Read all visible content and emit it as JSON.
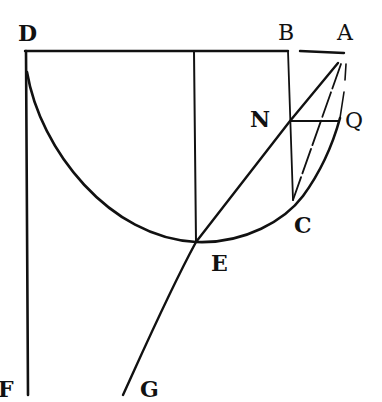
{
  "figure": {
    "type": "geometric-construction",
    "stroke_color": "#111111",
    "background": "#ffffff",
    "labels": [
      {
        "id": "D",
        "text": "D",
        "x": 18,
        "y": 22
      },
      {
        "id": "B",
        "text": "B",
        "x": 278,
        "y": 22
      },
      {
        "id": "A",
        "text": "A",
        "x": 337,
        "y": 22
      },
      {
        "id": "N",
        "text": "N",
        "x": 248,
        "y": 110
      },
      {
        "id": "Q",
        "text": "Q",
        "x": 345,
        "y": 110
      },
      {
        "id": "C",
        "text": "C",
        "x": 293,
        "y": 214
      },
      {
        "id": "E",
        "text": "E",
        "x": 211,
        "y": 252
      },
      {
        "id": "F",
        "text": "F",
        "x": 0,
        "y": 380
      },
      {
        "id": "G",
        "text": "G",
        "x": 140,
        "y": 380
      }
    ],
    "points": {
      "D": [
        25,
        51
      ],
      "B": [
        288,
        51
      ],
      "A": [
        344,
        53
      ],
      "N": [
        290,
        121
      ],
      "Q": [
        338,
        121
      ],
      "C": [
        293,
        200
      ],
      "E": [
        196,
        242
      ],
      "F": [
        28,
        395
      ],
      "G": [
        123,
        395
      ],
      "top_center": [
        196,
        51
      ]
    },
    "segments": [
      {
        "name": "top-line-DA",
        "from": "D",
        "to": "A"
      },
      {
        "name": "vertical-DF",
        "from": "D",
        "to": "F"
      },
      {
        "name": "vertical-center-E",
        "from": "top_center",
        "to": "E"
      },
      {
        "name": "vertical-BC",
        "from": "B",
        "to": "C"
      },
      {
        "name": "horizontal-NQ",
        "from": "N",
        "to": "Q"
      },
      {
        "name": "line-AN-E-G",
        "from": "A",
        "to": "G"
      },
      {
        "name": "line-A-C",
        "from": "A",
        "to": "C"
      }
    ],
    "curves": [
      {
        "name": "semicircle-D-E-C-A",
        "description": "semicircular arc from D through E and C to near A"
      }
    ]
  }
}
